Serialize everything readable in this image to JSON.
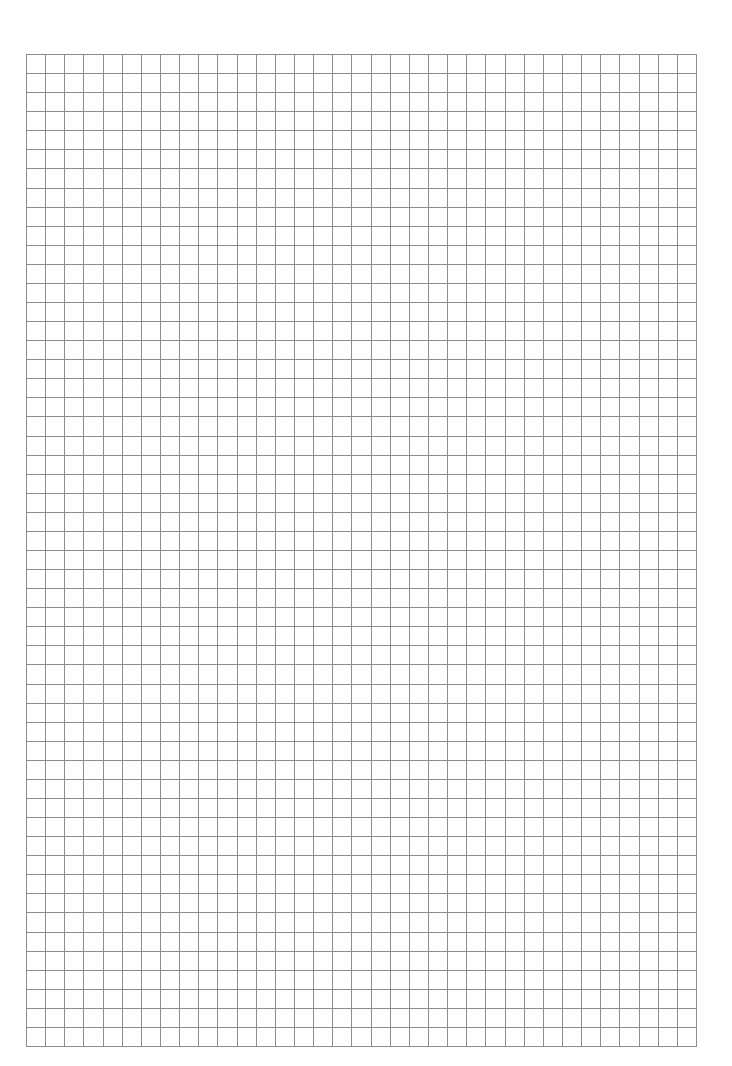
{
  "page": {
    "width": 732,
    "height": 1066,
    "background": "#ffffff"
  },
  "grid": {
    "type": "square-graph-paper",
    "left": 26,
    "top": 54,
    "right": 696,
    "bottom": 1046,
    "columns": 35,
    "rows": 52,
    "line_color": "#8c8c8c",
    "line_width": 1
  }
}
